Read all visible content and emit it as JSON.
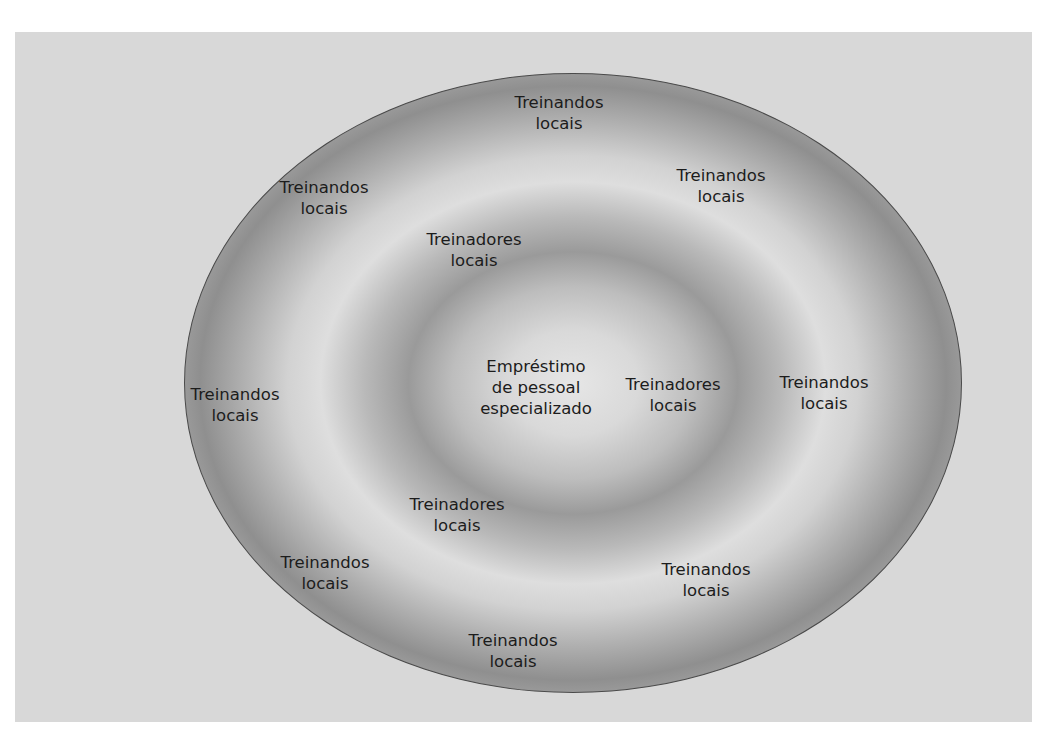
{
  "diagram": {
    "type": "concentric-rings",
    "center": {
      "lines": [
        "Empréstimo",
        "de pessoal",
        "especializado"
      ]
    },
    "inner_ring": {
      "items": [
        {
          "lines": [
            "Treinadores",
            "locais"
          ],
          "x": 474,
          "y": 250
        },
        {
          "lines": [
            "Treinadores",
            "locais"
          ],
          "x": 673,
          "y": 395
        },
        {
          "lines": [
            "Treinadores",
            "locais"
          ],
          "x": 457,
          "y": 515
        }
      ]
    },
    "outer_ring": {
      "items": [
        {
          "lines": [
            "Treinandos",
            "locais"
          ],
          "x": 559,
          "y": 113
        },
        {
          "lines": [
            "Treinandos",
            "locais"
          ],
          "x": 721,
          "y": 186
        },
        {
          "lines": [
            "Treinandos",
            "locais"
          ],
          "x": 324,
          "y": 198
        },
        {
          "lines": [
            "Treinandos",
            "locais"
          ],
          "x": 235,
          "y": 405
        },
        {
          "lines": [
            "Treinandos",
            "locais"
          ],
          "x": 824,
          "y": 393
        },
        {
          "lines": [
            "Treinandos",
            "locais"
          ],
          "x": 325,
          "y": 573
        },
        {
          "lines": [
            "Treinandos",
            "locais"
          ],
          "x": 706,
          "y": 580
        },
        {
          "lines": [
            "Treinandos",
            "locais"
          ],
          "x": 513,
          "y": 651
        }
      ]
    },
    "colors": {
      "panel_background": "#d8d8d8",
      "ring_light": "#e0e0e0",
      "ring_dark": "#8f8f8f",
      "outline": "#4a4a4a",
      "text": "#1c1c1c"
    }
  }
}
